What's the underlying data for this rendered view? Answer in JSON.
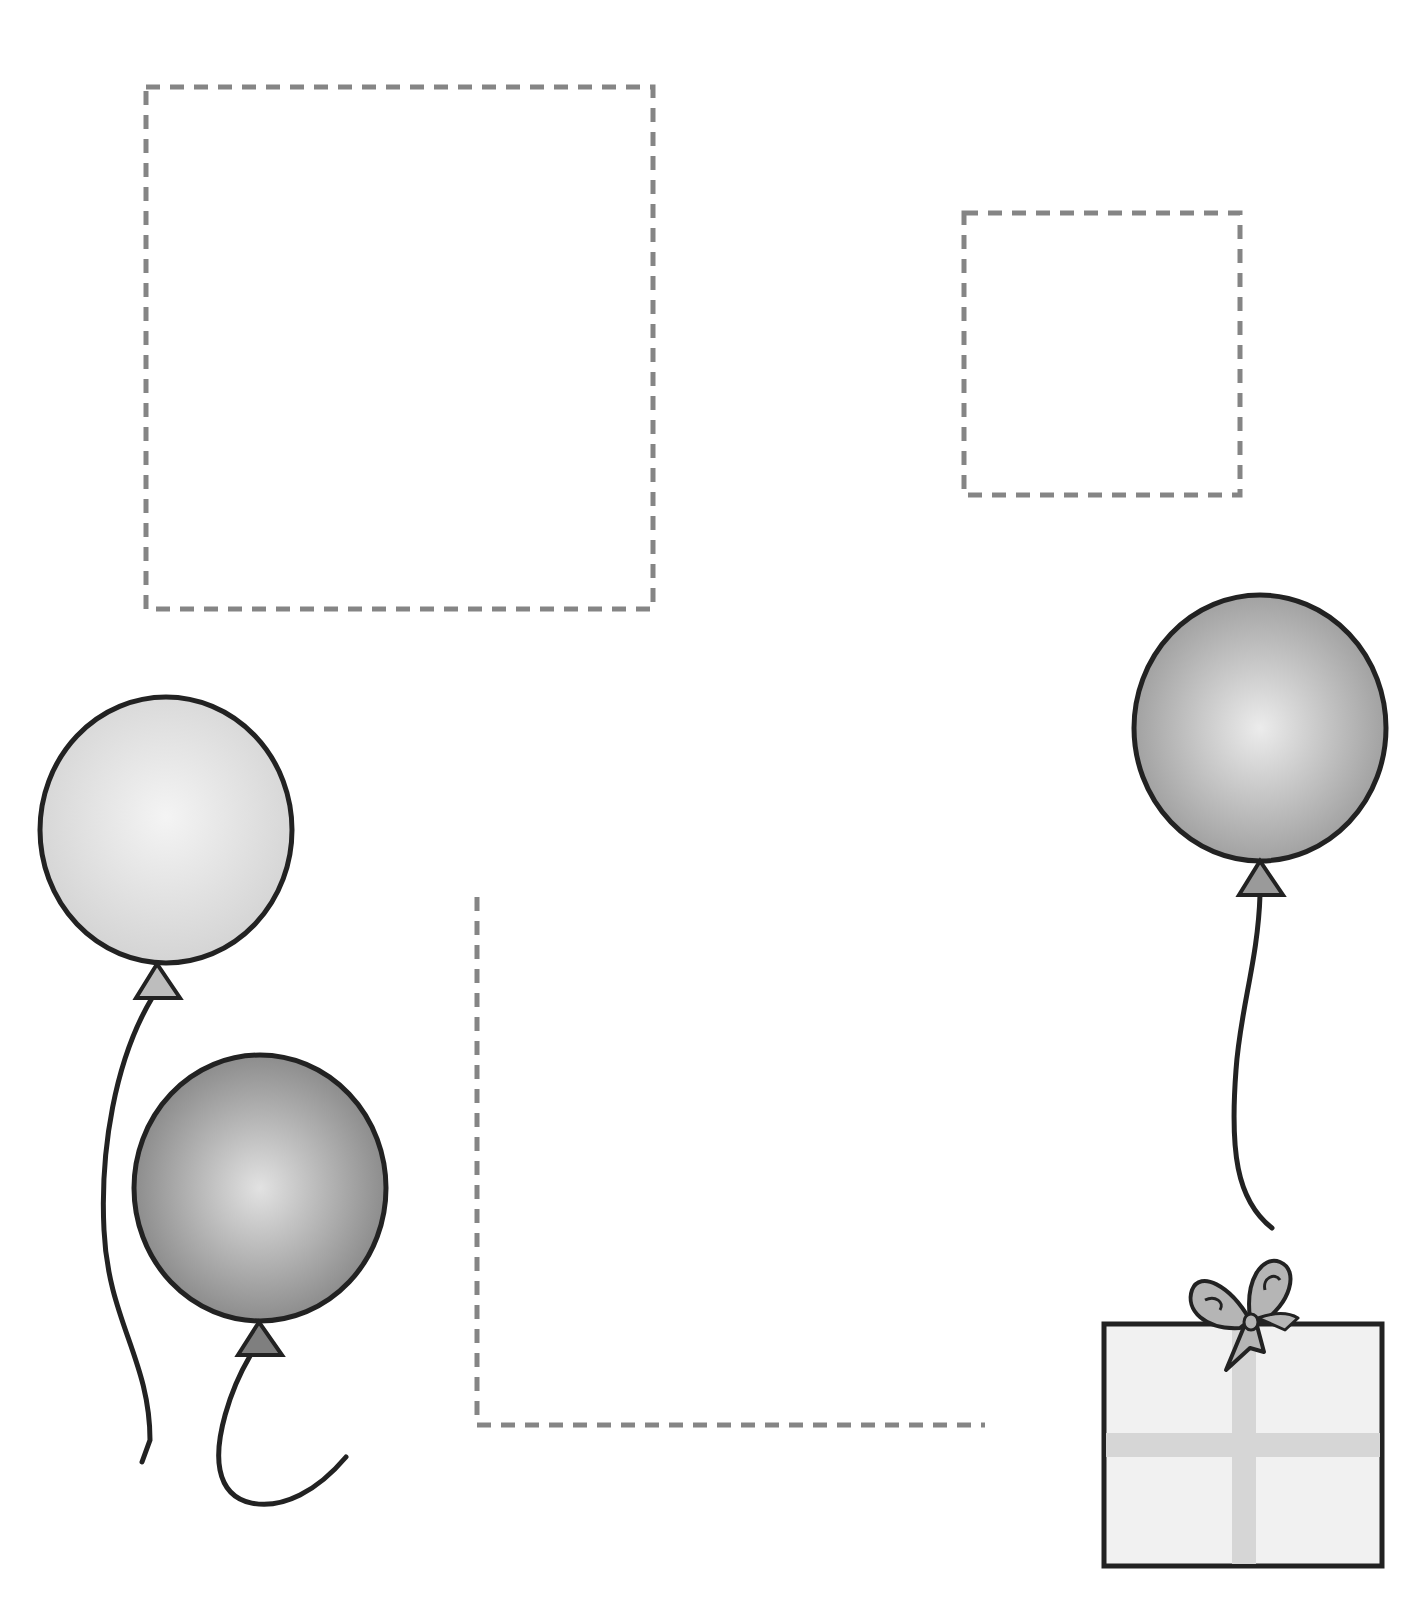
{
  "worksheet": {
    "title": "Balloon and gift tracing/cut-out worksheet",
    "colors": {
      "background": "#ffffff",
      "dash": "#858585",
      "outline": "#222222",
      "balloon_light": "#d9d9d9",
      "balloon_light_highlight": "#f4f4f4",
      "balloon_dark": "#8c8c8c",
      "balloon_dark_highlight": "#e2e2e2",
      "balloon_medium": "#a3a3a3",
      "balloon_medium_highlight": "#eaeaea",
      "gift_fill": "#f1f1f1",
      "ribbon": "#d6d6d6",
      "bow": "#b5b5b5"
    },
    "dashed_shapes": [
      {
        "id": "large-rectangle",
        "type": "rect",
        "x": 146,
        "y": 87,
        "w": 507,
        "h": 522
      },
      {
        "id": "small-square",
        "type": "rect",
        "x": 964,
        "y": 213,
        "w": 276,
        "h": 282
      },
      {
        "id": "l-corner",
        "type": "polyline",
        "points": "477,897 477,1425 985,1425"
      }
    ],
    "balloons": [
      {
        "id": "balloon-light",
        "shade": "light",
        "cx": 166,
        "cy": 830,
        "rx": 126,
        "ry": 133
      },
      {
        "id": "balloon-dark",
        "shade": "dark",
        "cx": 260,
        "cy": 1188,
        "rx": 126,
        "ry": 133
      },
      {
        "id": "balloon-medium",
        "shade": "medium",
        "cx": 1260,
        "cy": 728,
        "rx": 126,
        "ry": 133
      }
    ],
    "gift": {
      "id": "gift-box",
      "x": 1102,
      "y": 1322,
      "w": 282,
      "h": 246,
      "ribbon_x": 1244,
      "ribbon_y": 1445,
      "ribbon_width": 24
    }
  }
}
